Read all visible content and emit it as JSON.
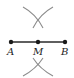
{
  "diagram": {
    "type": "perpendicular-bisector-construction",
    "segment": {
      "from": "A",
      "to": "B",
      "midpoint": "M"
    },
    "points": [
      {
        "label": "A",
        "x": 11,
        "y": 42
      },
      {
        "label": "M",
        "x": 38,
        "y": 42
      },
      {
        "label": "B",
        "x": 65,
        "y": 42
      }
    ],
    "arcs": [
      {
        "position": "above",
        "center_x": 38,
        "center_y": 17
      },
      {
        "position": "below",
        "center_x": 38,
        "center_y": 66
      }
    ],
    "colors": {
      "segment": "#2a2a2a",
      "arcs": "#8c8c8c",
      "points": "#1a1a1a"
    }
  }
}
